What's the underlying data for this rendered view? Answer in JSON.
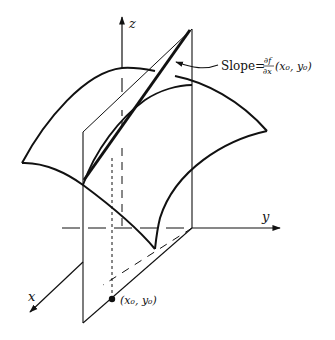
{
  "figure": {
    "type": "partial-derivative-illustration",
    "axes": {
      "x_label": "x",
      "y_label": "y",
      "z_label": "z"
    },
    "point_label": "(x₀, y₀)",
    "slope_label": {
      "prefix": "Slope=",
      "numerator": "∂f",
      "denominator": "∂x",
      "args": "(x₀, y₀)"
    },
    "colors": {
      "stroke": "#111111",
      "background": "#ffffff"
    }
  }
}
